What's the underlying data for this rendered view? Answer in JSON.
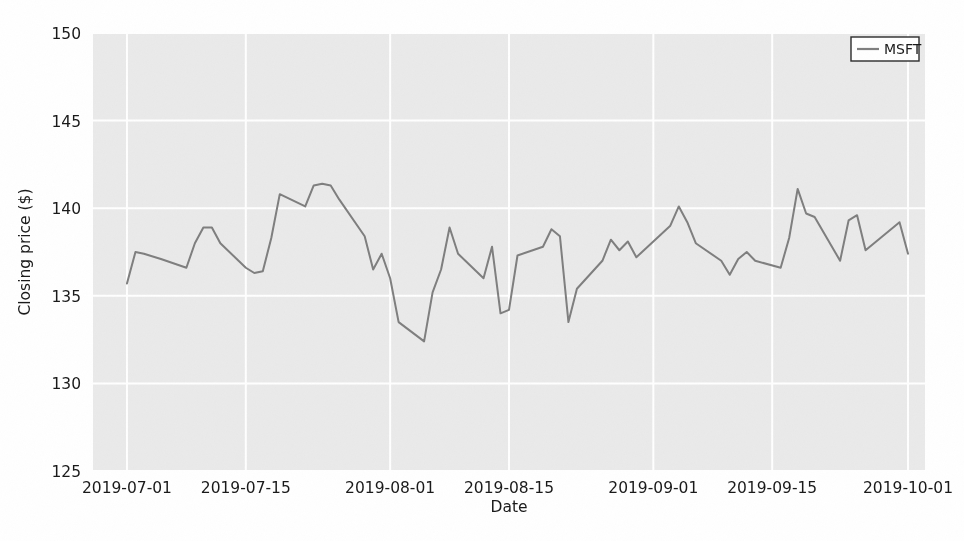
{
  "chart_data": {
    "type": "line",
    "title": "",
    "xlabel": "Date",
    "ylabel": "Closing price ($)",
    "ylim": [
      125,
      150
    ],
    "yticks": [
      125,
      130,
      135,
      140,
      145,
      150
    ],
    "ytick_labels": [
      "125",
      "130",
      "135",
      "140",
      "145",
      "150"
    ],
    "xtick_labels": [
      "2019-07-01",
      "2019-07-15",
      "2019-08-01",
      "2019-08-15",
      "2019-09-01",
      "2019-09-15",
      "2019-10-01"
    ],
    "xtick_dates": [
      "2019-07-01",
      "2019-07-15",
      "2019-08-01",
      "2019-08-15",
      "2019-09-01",
      "2019-09-15",
      "2019-10-01"
    ],
    "xlim": [
      "2019-06-27",
      "2019-10-03"
    ],
    "grid": true,
    "grid_color": "#ffffff",
    "plot_bg": "#eaeaea",
    "legend": {
      "position": "upper right",
      "entries": [
        {
          "name": "MSFT",
          "color": "#7f7f7f"
        }
      ]
    },
    "series": [
      {
        "name": "MSFT",
        "color": "#7f7f7f",
        "linewidth": 2,
        "x": [
          "2019-07-01",
          "2019-07-02",
          "2019-07-03",
          "2019-07-05",
          "2019-07-08",
          "2019-07-09",
          "2019-07-10",
          "2019-07-11",
          "2019-07-12",
          "2019-07-15",
          "2019-07-16",
          "2019-07-17",
          "2019-07-18",
          "2019-07-19",
          "2019-07-22",
          "2019-07-23",
          "2019-07-24",
          "2019-07-25",
          "2019-07-26",
          "2019-07-29",
          "2019-07-30",
          "2019-07-31",
          "2019-08-01",
          "2019-08-02",
          "2019-08-05",
          "2019-08-06",
          "2019-08-07",
          "2019-08-08",
          "2019-08-09",
          "2019-08-12",
          "2019-08-13",
          "2019-08-14",
          "2019-08-15",
          "2019-08-16",
          "2019-08-19",
          "2019-08-20",
          "2019-08-21",
          "2019-08-22",
          "2019-08-23",
          "2019-08-26",
          "2019-08-27",
          "2019-08-28",
          "2019-08-29",
          "2019-08-30",
          "2019-09-03",
          "2019-09-04",
          "2019-09-05",
          "2019-09-06",
          "2019-09-09",
          "2019-09-10",
          "2019-09-11",
          "2019-09-12",
          "2019-09-13",
          "2019-09-16",
          "2019-09-17",
          "2019-09-18",
          "2019-09-19",
          "2019-09-20",
          "2019-09-23",
          "2019-09-24",
          "2019-09-25",
          "2019-09-26",
          "2019-09-27",
          "2019-09-30",
          "2019-10-01"
        ],
        "y": [
          135.7,
          137.5,
          137.4,
          137.1,
          136.6,
          138.0,
          138.9,
          138.9,
          138.0,
          136.6,
          136.3,
          136.4,
          138.3,
          140.8,
          140.1,
          141.3,
          141.4,
          141.3,
          140.5,
          138.4,
          136.5,
          137.4,
          136.0,
          133.5,
          132.4,
          135.2,
          136.5,
          138.9,
          137.4,
          136.0,
          137.8,
          134.0,
          134.2,
          137.3,
          137.8,
          138.8,
          138.4,
          133.5,
          135.4,
          137.0,
          138.2,
          137.6,
          138.1,
          137.2,
          139.0,
          140.1,
          139.2,
          138.0,
          137.0,
          136.2,
          137.1,
          137.5,
          137.0,
          136.6,
          138.3,
          141.1,
          139.7,
          139.5,
          137.0,
          139.3,
          139.6,
          137.6,
          138.0,
          139.2,
          137.4
        ]
      }
    ]
  },
  "figure": {
    "width": 964,
    "height": 541,
    "background": "#ffffff"
  }
}
